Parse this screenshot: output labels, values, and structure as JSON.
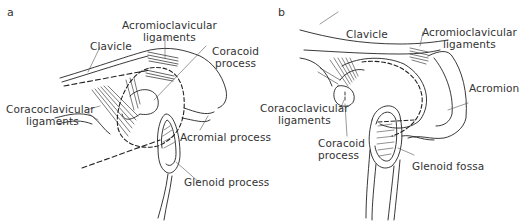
{
  "panels": [
    {
      "letter": "a",
      "labels": {
        "clavicle": "Clavicle",
        "acromioclavicular_1": "Acromioclavicular",
        "acromioclavicular_2": "ligaments",
        "coracoid_1": "Coracoid",
        "coracoid_2": "process",
        "coracoclavicular_1": "Coracoclavicular",
        "coracoclavicular_2": "ligaments",
        "acromial": "Acromial process",
        "glenoid": "Glenoid process"
      }
    },
    {
      "letter": "b",
      "labels": {
        "clavicle": "Clavicle",
        "acromioclavicular_1": "Acromioclavicular",
        "acromioclavicular_2": "ligaments",
        "acromion": "Acromion",
        "coracoclavicular_1": "Coracoclavicular",
        "coracoclavicular_2": "ligaments",
        "coracoid_1": "Coracoid",
        "coracoid_2": "process",
        "glenoid_fossa": "Glenoid fossa"
      }
    }
  ]
}
